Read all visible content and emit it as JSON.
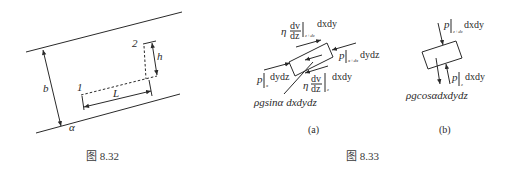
{
  "figure_832": {
    "caption": "图 8.32",
    "labels": {
      "b": "b",
      "h": "h",
      "L": "L",
      "point1": "1",
      "point2": "2",
      "alpha": "α"
    }
  },
  "figure_833": {
    "caption": "图 8.33",
    "panel_a": {
      "label": "(a)",
      "shear_top": {
        "coef": "η",
        "num": "dv",
        "den": "dz",
        "sub": "z+dz",
        "tail": "dxdy"
      },
      "shear_bottom": {
        "coef": "η",
        "num": "dv",
        "den": "dz",
        "sub": "z",
        "tail": "dxdy"
      },
      "pressure_left": {
        "p": "p",
        "sub": "x",
        "tail": "dydz"
      },
      "pressure_right": {
        "p": "p",
        "sub": "x+dx",
        "tail": "dydz"
      },
      "gravity": "ρgsinα dxdydz"
    },
    "panel_b": {
      "label": "(b)",
      "pressure_top": {
        "p": "p",
        "sub": "z+dz",
        "tail": "dxdy"
      },
      "pressure_bottom": {
        "p": "p",
        "sub": "z",
        "tail": "dxdy"
      },
      "gravity": "ρgcosαdxdydz"
    }
  }
}
